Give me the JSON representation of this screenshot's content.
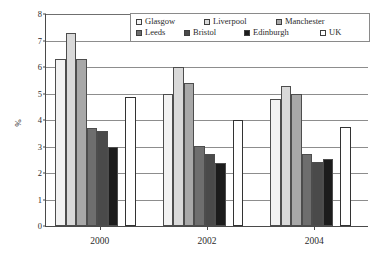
{
  "chart_data": {
    "type": "bar",
    "title": "",
    "xlabel": "",
    "ylabel": "%",
    "categories": [
      "2000",
      "2002",
      "2004"
    ],
    "ylim": [
      0,
      8
    ],
    "yticks": [
      0,
      1,
      2,
      3,
      4,
      5,
      6,
      7,
      8
    ],
    "ytick_labels": [
      "0",
      "1",
      "2",
      "3",
      "4",
      "5",
      "6",
      "7",
      "8"
    ],
    "grid": true,
    "legend_position": "top-right",
    "series": [
      {
        "name": "Glasgow",
        "color": "#f2f2f2",
        "values": [
          6.3,
          5.0,
          4.8
        ]
      },
      {
        "name": "Liverpool",
        "color": "#d9d9d9",
        "values": [
          7.3,
          6.0,
          5.3
        ]
      },
      {
        "name": "Manchester",
        "color": "#a8a8a8",
        "values": [
          6.3,
          5.4,
          5.0
        ]
      },
      {
        "name": "Leeds",
        "color": "#6e6e6e",
        "values": [
          3.68,
          3.02,
          2.7
        ]
      },
      {
        "name": "Bristol",
        "color": "#4a4a4a",
        "values": [
          3.6,
          2.7,
          2.4
        ]
      },
      {
        "name": "Edinburgh",
        "color": "#1c1c1c",
        "values": [
          3.0,
          2.38,
          2.52
        ]
      },
      {
        "name": "UK",
        "color": "#ffffff",
        "values": [
          4.88,
          4.0,
          3.72
        ]
      }
    ]
  }
}
